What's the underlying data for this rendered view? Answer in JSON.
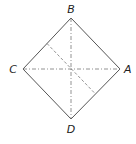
{
  "diagram": {
    "type": "folded-square-diagram",
    "colors": {
      "outline": "#555555",
      "fold_lines": "#777777",
      "label": "#222222",
      "background": "#ffffff"
    },
    "vertices": [
      {
        "id": "B",
        "label": "B",
        "position": "top",
        "x": 71,
        "y": 18
      },
      {
        "id": "A",
        "label": "A",
        "position": "right",
        "x": 120,
        "y": 69
      },
      {
        "id": "D",
        "label": "D",
        "position": "bottom",
        "x": 71,
        "y": 119
      },
      {
        "id": "C",
        "label": "C",
        "position": "left",
        "x": 23,
        "y": 69
      }
    ],
    "edges": [
      {
        "from": "B",
        "to": "A",
        "style": "solid"
      },
      {
        "from": "A",
        "to": "D",
        "style": "solid"
      },
      {
        "from": "D",
        "to": "C",
        "style": "solid"
      },
      {
        "from": "C",
        "to": "B",
        "style": "solid"
      }
    ],
    "fold_lines": [
      {
        "name": "vertical-diagonal",
        "from": "B",
        "to": "D",
        "style": "dash-dot"
      },
      {
        "name": "horizontal-diagonal",
        "from": "C",
        "to": "A",
        "style": "dash-dot"
      },
      {
        "name": "midline",
        "from": "midpoint CB",
        "to": "midpoint AD",
        "style": "dashed"
      }
    ]
  }
}
